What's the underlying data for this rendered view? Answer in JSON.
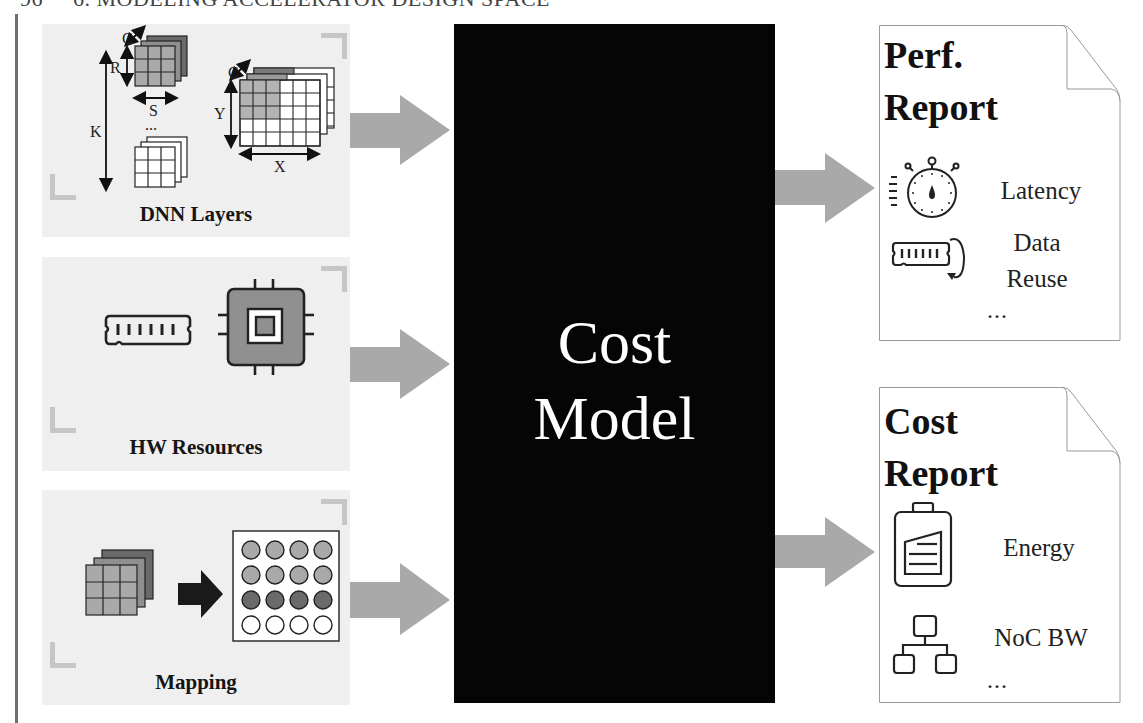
{
  "page_header": {
    "page_number": "96",
    "chapter_title": "6. MODELING ACCELERATOR DESIGN SPACE"
  },
  "inputs": [
    {
      "label": "DNN Layers",
      "dimension_labels": {
        "weight_channel": "C",
        "weight_height": "R",
        "weight_width": "S",
        "num_filters": "K",
        "input_channel": "C",
        "input_height": "Y",
        "input_width": "X",
        "ellipsis": "..."
      },
      "icon": "dnn-tensor-icon"
    },
    {
      "label": "HW Resources",
      "icons": [
        "memory-module-icon",
        "processor-chip-icon"
      ]
    },
    {
      "label": "Mapping",
      "icons": [
        "tensor-stack-icon",
        "right-arrow-icon",
        "pe-array-icon"
      ]
    }
  ],
  "cost_model": {
    "line1": "Cost",
    "line2": "Model"
  },
  "outputs": [
    {
      "title_line1": "Perf.",
      "title_line2": "Report",
      "metrics": [
        {
          "label": "Latency",
          "icon": "stopwatch-icon"
        },
        {
          "label_line1": "Data",
          "label_line2": "Reuse",
          "icon": "memory-reuse-icon"
        }
      ],
      "ellipsis": "..."
    },
    {
      "title_line1": "Cost",
      "title_line2": "Report",
      "metrics": [
        {
          "label": "Energy",
          "icon": "battery-icon"
        },
        {
          "label": "NoC BW",
          "icon": "network-hierarchy-icon"
        }
      ],
      "ellipsis": "..."
    }
  ],
  "colors": {
    "panel_bg": "#efefef",
    "corner_mark": "#c6c6c6",
    "arrow": "#a9a9a9",
    "cost_model_bg": "#050505",
    "cost_model_text": "#ffffff",
    "tensor_light": "#b3b3b3",
    "tensor_mid": "#8f8f8f",
    "tensor_dark": "#6a6a6a"
  }
}
